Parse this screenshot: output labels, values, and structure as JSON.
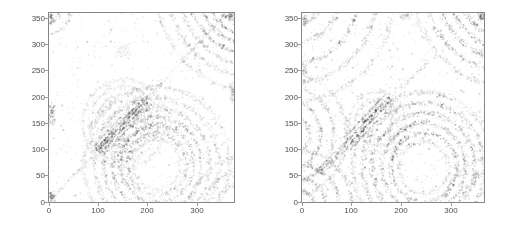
{
  "page": {
    "background": "#ffffff"
  },
  "style": {
    "axis_color": "#858585",
    "tick_mark_color": "#9a9a9a",
    "tick_label_color": "#4d4d4d",
    "ink_rgb": "42,42,42"
  },
  "chart_data": [
    {
      "type": "heatmap",
      "name": "recurrence-plot-left",
      "title": "",
      "xlabel": "",
      "ylabel": "",
      "x_ticks": [
        0,
        100,
        200,
        300
      ],
      "y_ticks": [
        0,
        50,
        100,
        150,
        200,
        250,
        300,
        350
      ],
      "xlim": [
        0,
        374
      ],
      "ylim": [
        0,
        360
      ],
      "grid": false,
      "legend": null,
      "description": "Grainy grayscale distance-matrix image: bullseye rings in lower right, dark diagonal band through center, diagonal streak cluster in upper right corner, speckle noise throughout.",
      "seed": 7,
      "speckle": {
        "density": 0.035,
        "alpha": 0.28
      },
      "ringsets": [
        {
          "cx": 218,
          "cy": 72,
          "radii": [
            48,
            60,
            74,
            90,
            107,
            126,
            148
          ],
          "alphas": [
            0.22,
            0.5,
            0.55,
            0.45,
            0.35,
            0.3,
            0.22
          ],
          "width": 7,
          "bias_deg": 115,
          "bias_strength": 0.45
        },
        {
          "cx": 412,
          "cy": 410,
          "radii": [
            58,
            78,
            95,
            112,
            130,
            150,
            172,
            197
          ],
          "alphas": [
            0.55,
            0.62,
            0.55,
            0.45,
            0.4,
            0.33,
            0.28,
            0.2
          ],
          "width": 6,
          "bias_deg": 225,
          "bias_strength": 0.25
        },
        {
          "cx": 152,
          "cy": 150,
          "radii": [
            30,
            43,
            56,
            70,
            84
          ],
          "alphas": [
            0.2,
            0.22,
            0.2,
            0.18,
            0.15
          ],
          "width": 6,
          "bias_deg": 0,
          "bias_strength": 0
        },
        {
          "cx": 383,
          "cy": -12,
          "radii": [
            45,
            70,
            95
          ],
          "alphas": [
            0.3,
            0.28,
            0.22
          ],
          "width": 6,
          "bias_deg": 90,
          "bias_strength": 0.2
        },
        {
          "cx": -5,
          "cy": 368,
          "radii": [
            28,
            48
          ],
          "alphas": [
            0.35,
            0.25
          ],
          "width": 5,
          "bias_deg": 315,
          "bias_strength": 0.2
        }
      ],
      "bands": [
        {
          "x1": 98,
          "y1": 96,
          "x2": 198,
          "y2": 196,
          "offsets": [
            -13,
            -6,
            0,
            6,
            13
          ],
          "alphas": [
            0.25,
            0.5,
            0.62,
            0.48,
            0.25
          ],
          "width": 3
        },
        {
          "x1": 5,
          "y1": 5,
          "x2": 358,
          "y2": 358,
          "offsets": [
            0
          ],
          "alphas": [
            0.14
          ],
          "width": 4
        }
      ],
      "patches": [
        {
          "cx": 5,
          "cy": 168,
          "rx": 9,
          "ry": 27,
          "alpha": 0.4
        },
        {
          "cx": 4,
          "cy": 352,
          "rx": 7,
          "ry": 14,
          "alpha": 0.45
        },
        {
          "cx": 5,
          "cy": 10,
          "rx": 8,
          "ry": 11,
          "alpha": 0.45
        },
        {
          "cx": 371,
          "cy": 207,
          "rx": 6,
          "ry": 22,
          "alpha": 0.28
        },
        {
          "cx": 150,
          "cy": 288,
          "rx": 20,
          "ry": 15,
          "alpha": 0.14
        },
        {
          "cx": 368,
          "cy": 355,
          "rx": 8,
          "ry": 10,
          "alpha": 0.4
        }
      ]
    },
    {
      "type": "heatmap",
      "name": "recurrence-plot-right",
      "title": "",
      "xlabel": "",
      "ylabel": "",
      "x_ticks": [
        0,
        100,
        200,
        300
      ],
      "y_ticks": [
        0,
        50,
        100,
        150,
        200,
        250,
        300,
        350
      ],
      "xlim": [
        0,
        366
      ],
      "ylim": [
        0,
        360
      ],
      "grid": false,
      "legend": null,
      "description": "Grainy grayscale distance-matrix image: bullseye rings in lower right, off-diagonal dark streak band left of center, strong diagonal streaks in upper right corner, arcs along left edge and corners, speckle noise throughout.",
      "seed": 13,
      "speckle": {
        "density": 0.05,
        "alpha": 0.26
      },
      "ringsets": [
        {
          "cx": 245,
          "cy": 66,
          "radii": [
            50,
            66,
            84,
            103,
            123,
            143
          ],
          "alphas": [
            0.28,
            0.55,
            0.5,
            0.45,
            0.38,
            0.3
          ],
          "width": 7,
          "bias_deg": 120,
          "bias_strength": 0.4
        },
        {
          "cx": 415,
          "cy": 415,
          "radii": [
            62,
            82,
            102,
            122,
            144,
            168,
            194
          ],
          "alphas": [
            0.5,
            0.65,
            0.6,
            0.5,
            0.42,
            0.34,
            0.26
          ],
          "width": 7,
          "bias_deg": 225,
          "bias_strength": 0.2
        },
        {
          "cx": -28,
          "cy": 128,
          "radii": [
            42,
            66,
            92,
            118
          ],
          "alphas": [
            0.38,
            0.42,
            0.33,
            0.24
          ],
          "width": 6,
          "bias_deg": 0,
          "bias_strength": 0.2
        },
        {
          "cx": -15,
          "cy": 392,
          "radii": [
            55,
            90,
            128,
            165,
            200
          ],
          "alphas": [
            0.3,
            0.42,
            0.38,
            0.28,
            0.2
          ],
          "width": 7,
          "bias_deg": 315,
          "bias_strength": 0.3
        },
        {
          "cx": -8,
          "cy": -12,
          "radii": [
            34,
            58,
            84,
            110
          ],
          "alphas": [
            0.42,
            0.48,
            0.38,
            0.28
          ],
          "width": 6,
          "bias_deg": 45,
          "bias_strength": 0.2
        },
        {
          "cx": 398,
          "cy": -25,
          "radii": [
            55,
            85,
            115
          ],
          "alphas": [
            0.32,
            0.38,
            0.28
          ],
          "width": 6,
          "bias_deg": 135,
          "bias_strength": 0.2
        },
        {
          "cx": 152,
          "cy": 152,
          "radii": [
            30,
            44,
            58
          ],
          "alphas": [
            0.18,
            0.18,
            0.15
          ],
          "width": 6,
          "bias_deg": 0,
          "bias_strength": 0
        }
      ],
      "bands": [
        {
          "x1": 88,
          "y1": 108,
          "x2": 178,
          "y2": 198,
          "offsets": [
            -12,
            -4,
            4,
            12
          ],
          "alphas": [
            0.3,
            0.62,
            0.55,
            0.3
          ],
          "width": 3
        },
        {
          "x1": 35,
          "y1": 55,
          "x2": 88,
          "y2": 108,
          "offsets": [
            -6,
            0,
            6
          ],
          "alphas": [
            0.25,
            0.38,
            0.25
          ],
          "width": 3
        },
        {
          "x1": 195,
          "y1": 215,
          "x2": 255,
          "y2": 268,
          "offsets": [
            0
          ],
          "alphas": [
            0.18
          ],
          "width": 5
        }
      ],
      "patches": [
        {
          "cx": 5,
          "cy": 345,
          "rx": 8,
          "ry": 14,
          "alpha": 0.4
        },
        {
          "cx": 368,
          "cy": 300,
          "rx": 6,
          "ry": 18,
          "alpha": 0.22
        },
        {
          "cx": 210,
          "cy": 354,
          "rx": 18,
          "ry": 8,
          "alpha": 0.2
        },
        {
          "cx": 5,
          "cy": 250,
          "rx": 6,
          "ry": 15,
          "alpha": 0.25
        },
        {
          "cx": 360,
          "cy": 352,
          "rx": 8,
          "ry": 9,
          "alpha": 0.45
        }
      ]
    }
  ]
}
